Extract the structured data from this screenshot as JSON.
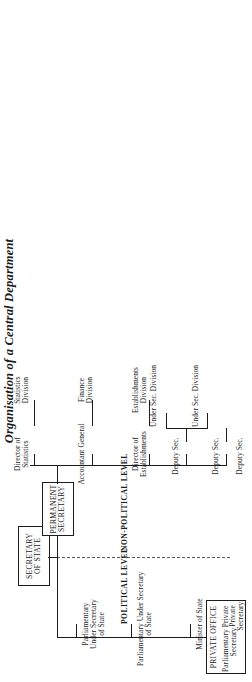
{
  "document": {
    "title": "Organisation of a Central Department",
    "type": "organisational-chart"
  },
  "dividers": {
    "political": "POLITICAL LEVEL",
    "non_political": "NON-POLITICAL LEVEL"
  },
  "boxes": {
    "secretary_of_state": "SECRETARY\nOF STATE",
    "permanent_secretary": "PERMANENT\nSECRETARY",
    "private_office": {
      "heading": "PRIVATE OFFICE",
      "political_role": "Parliamentary Private\nSecretary",
      "non_political_role": "Private\nSecretary"
    }
  },
  "political_branch": [
    {
      "label": "Parliamentary\nUnder Secretary\nof State"
    },
    {
      "label": "Parliamentary Under Secretary\nof State"
    },
    {
      "label": "Minister of State"
    }
  ],
  "non_political_branch": [
    {
      "label": "Director of\nStatistics",
      "children": [
        {
          "label": "Statistics\nDivision"
        }
      ]
    },
    {
      "label": "Accountant General",
      "children": [
        {
          "label": "Finance\nDivision"
        }
      ]
    },
    {
      "label": "Director of\nEstablishments",
      "children": [
        {
          "label": "Establishments\nDivision"
        }
      ]
    },
    {
      "label": "Deputy Sec.",
      "children": [
        {
          "label": "Under Sec.",
          "division": "Division"
        },
        {
          "label": "Under Sec.",
          "division": "Division"
        }
      ]
    },
    {
      "label": "Deputy Sec.",
      "children": [
        {
          "label": "Under Sec.",
          "division": "Division"
        },
        {
          "label": "Under Sec.",
          "division": "Division"
        }
      ]
    },
    {
      "label": "Deputy Sec.",
      "children": [
        {
          "label": "Under Sec.",
          "division": "Division"
        },
        {
          "label": "Under Sec.",
          "division": "Division"
        }
      ]
    }
  ],
  "colors": {
    "ink": "#1c1c1c",
    "paper": "#ffffff",
    "divider": "#5a5a5a"
  }
}
